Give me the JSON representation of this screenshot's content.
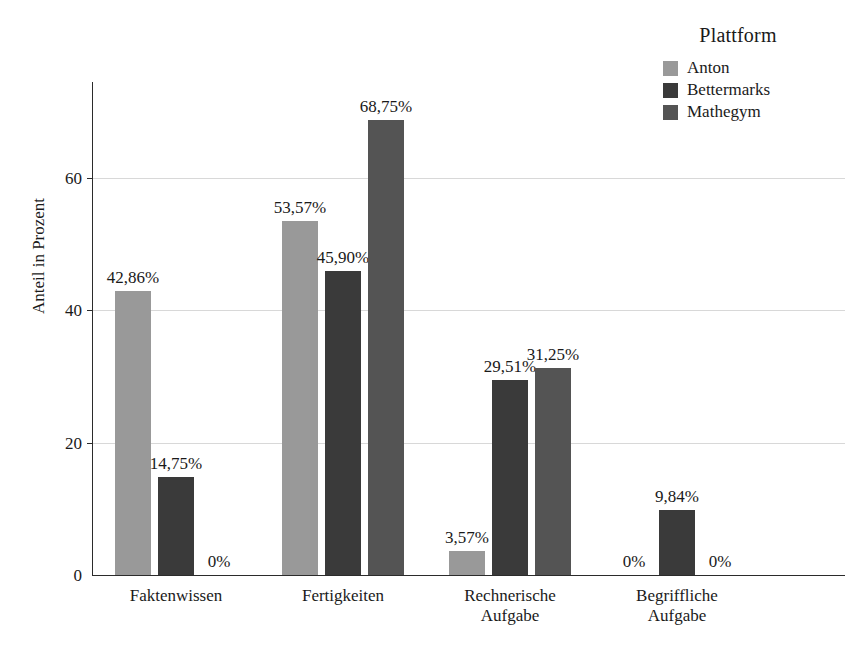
{
  "legend": {
    "title": "Plattform",
    "items": [
      {
        "label": "Anton",
        "color": "#999999"
      },
      {
        "label": "Bettermarks",
        "color": "#3a3a3a"
      },
      {
        "label": "Mathegym",
        "color": "#545454"
      }
    ]
  },
  "axes": {
    "ylabel": "Anteil in Prozent",
    "yticks": [
      "0",
      "20",
      "40",
      "60"
    ],
    "xlabel": ""
  },
  "chart_data": {
    "type": "bar",
    "title": "",
    "subtitle": "",
    "xlabel": "",
    "ylabel": "Anteil in Prozent",
    "legend_title": "Plattform",
    "legend_position": "top-right",
    "grid": true,
    "ylim": [
      0,
      75
    ],
    "ytick_values": [
      0,
      20,
      40,
      60
    ],
    "ytick_labels": [
      "0",
      "20",
      "40",
      "60"
    ],
    "categories": [
      "Faktenwissen",
      "Fertigkeiten",
      "Rechnerische\nAufgabe",
      "Begriffliche\nAufgabe"
    ],
    "series": [
      {
        "name": "Anton",
        "color": "#999999",
        "values": [
          42.86,
          53.57,
          3.57,
          0
        ],
        "labels": [
          "42,86%",
          "53,57%",
          "3,57%",
          "0%"
        ]
      },
      {
        "name": "Bettermarks",
        "color": "#3a3a3a",
        "values": [
          14.75,
          45.9,
          29.51,
          9.84
        ],
        "labels": [
          "14,75%",
          "45,90%",
          "29,51%",
          "9,84%"
        ]
      },
      {
        "name": "Mathegym",
        "color": "#545454",
        "values": [
          0,
          68.75,
          31.25,
          0
        ],
        "labels": [
          "0%",
          "68,75%",
          "31,25%",
          "0%"
        ]
      }
    ]
  }
}
